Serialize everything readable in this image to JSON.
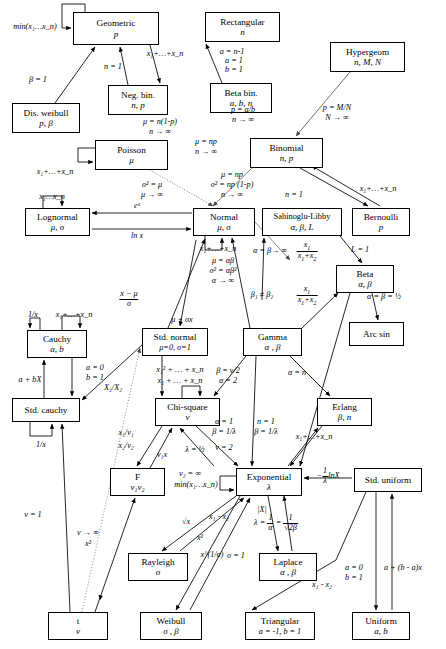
{
  "diagram": {
    "type": "directed-graph",
    "background": "#ffffff",
    "stroke": "#000000"
  },
  "nodes": [
    {
      "id": "geometric",
      "name": "Geometric",
      "params": "p",
      "x": 73,
      "y": 12,
      "w": 86,
      "h": 33
    },
    {
      "id": "rectangular",
      "name": "Rectangular",
      "params": "n",
      "x": 205,
      "y": 12,
      "w": 75,
      "h": 30
    },
    {
      "id": "hypergeom",
      "name": "Hypergeom",
      "params": "n, M, N",
      "x": 330,
      "y": 42,
      "w": 75,
      "h": 30
    },
    {
      "id": "negbin",
      "name": "Neg. bin.",
      "params": "n, p",
      "x": 108,
      "y": 85,
      "w": 60,
      "h": 30
    },
    {
      "id": "betabin",
      "name": "Beta bin.",
      "params": "a, b, n",
      "x": 210,
      "y": 83,
      "w": 62,
      "h": 30
    },
    {
      "id": "disweibull",
      "name": "Dis. weibull",
      "params": "p, β",
      "x": 12,
      "y": 103,
      "w": 68,
      "h": 30
    },
    {
      "id": "poisson",
      "name": "Poisson",
      "params": "μ",
      "x": 95,
      "y": 140,
      "w": 73,
      "h": 30
    },
    {
      "id": "binomial",
      "name": "Binomial",
      "params": "n, p",
      "x": 250,
      "y": 138,
      "w": 73,
      "h": 30
    },
    {
      "id": "lognormal",
      "name": "Lognormal",
      "params": "μ, σ",
      "x": 25,
      "y": 208,
      "w": 65,
      "h": 28
    },
    {
      "id": "normal",
      "name": "Normal",
      "params": "μ, σ",
      "x": 193,
      "y": 208,
      "w": 62,
      "h": 28
    },
    {
      "id": "sahinoglu",
      "name": "Sahinoglu-Libby",
      "params": "α, β, L",
      "x": 262,
      "y": 208,
      "w": 80,
      "h": 28
    },
    {
      "id": "bernoulli",
      "name": "Bernoulli",
      "params": "p",
      "x": 352,
      "y": 208,
      "w": 58,
      "h": 28
    },
    {
      "id": "beta",
      "name": "Beta",
      "params": "α, β",
      "x": 336,
      "y": 265,
      "w": 58,
      "h": 28
    },
    {
      "id": "arcsin",
      "name": "Arc sin",
      "params": "",
      "x": 349,
      "y": 322,
      "w": 55,
      "h": 24
    },
    {
      "id": "cauchy",
      "name": "Cauchy",
      "params": "a, b",
      "x": 27,
      "y": 330,
      "w": 60,
      "h": 28
    },
    {
      "id": "stdnormal",
      "name": "Std. normal",
      "params": "μ=0, σ=1",
      "x": 142,
      "y": 328,
      "w": 66,
      "h": 28
    },
    {
      "id": "gamma",
      "name": "Gamma",
      "params": "α , β",
      "x": 243,
      "y": 328,
      "w": 59,
      "h": 28
    },
    {
      "id": "stdcauchy",
      "name": "Std. cauchy",
      "params": "",
      "x": 12,
      "y": 398,
      "w": 68,
      "h": 24
    },
    {
      "id": "chisquare",
      "name": "Chi-square",
      "params": "ν",
      "x": 155,
      "y": 398,
      "w": 65,
      "h": 28
    },
    {
      "id": "erlang",
      "name": "Erlang",
      "params": "β, n",
      "x": 317,
      "y": 398,
      "w": 55,
      "h": 28
    },
    {
      "id": "f",
      "name": "F",
      "params": "ν₁ν₂",
      "x": 110,
      "y": 468,
      "w": 55,
      "h": 28
    },
    {
      "id": "exponential",
      "name": "Exponential",
      "params": "λ",
      "x": 236,
      "y": 468,
      "w": 66,
      "h": 28
    },
    {
      "id": "stduniform",
      "name": "Std. uniform",
      "params": "",
      "x": 354,
      "y": 468,
      "w": 68,
      "h": 24
    },
    {
      "id": "rayleigh",
      "name": "Rayleigh",
      "params": "σ",
      "x": 128,
      "y": 553,
      "w": 60,
      "h": 28
    },
    {
      "id": "laplace",
      "name": "Laplace",
      "params": "α , β",
      "x": 259,
      "y": 553,
      "w": 58,
      "h": 28
    },
    {
      "id": "t",
      "name": "t",
      "params": "ν",
      "x": 48,
      "y": 612,
      "w": 60,
      "h": 28
    },
    {
      "id": "weibull",
      "name": "Weibull",
      "params": "σ , β",
      "x": 140,
      "y": 612,
      "w": 62,
      "h": 28
    },
    {
      "id": "triangular",
      "name": "Triangular",
      "params": "a = -1, b = 1",
      "x": 245,
      "y": 612,
      "w": 70,
      "h": 28
    },
    {
      "id": "uniform",
      "name": "Uniform",
      "params": "a, b",
      "x": 352,
      "y": 612,
      "w": 58,
      "h": 28
    }
  ],
  "edge_labels": [
    {
      "id": "l-min-geom",
      "text": "min(x₁…x_n)",
      "x": 35,
      "y": 22
    },
    {
      "id": "l-sum-geom",
      "text": "x₁+…+x_n",
      "x": 165,
      "y": 49
    },
    {
      "id": "l-n1-geom",
      "text": "n = 1",
      "x": 113,
      "y": 62
    },
    {
      "id": "l-beta1",
      "text": "β = 1",
      "x": 38,
      "y": 75
    },
    {
      "id": "l-an1",
      "text": "a = n-1",
      "x": 222,
      "y": 48
    },
    {
      "id": "l-a1",
      "text": "a = 1",
      "x": 224,
      "y": 57
    },
    {
      "id": "l-b1",
      "text": "b = 1",
      "x": 224,
      "y": 66
    },
    {
      "id": "l-pab",
      "text": "p = a/b",
      "x": 222,
      "y": 106
    },
    {
      "id": "l-ninf1",
      "text": "n → ∞",
      "x": 222,
      "y": 116
    },
    {
      "id": "l-pmn",
      "text": "p = M/N",
      "x": 337,
      "y": 103
    },
    {
      "id": "l-ninf2",
      "text": "N → ∞",
      "x": 337,
      "y": 113
    },
    {
      "id": "l-munp1",
      "text": "μ = n(1-p)",
      "x": 143,
      "y": 117
    },
    {
      "id": "l-ninf3",
      "text": "n → ∞",
      "x": 143,
      "y": 127
    },
    {
      "id": "l-munp2",
      "text": "μ = np",
      "x": 192,
      "y": 138
    },
    {
      "id": "l-ninf4",
      "text": "n → ∞",
      "x": 192,
      "y": 148
    },
    {
      "id": "l-sum-poisson",
      "text": "x₁+…+x_n",
      "x": 40,
      "y": 168
    },
    {
      "id": "l-sigmamu",
      "text": "σ² = μ",
      "x": 135,
      "y": 180
    },
    {
      "id": "l-muinf",
      "text": "μ → ∞",
      "x": 135,
      "y": 190
    },
    {
      "id": "l-xs",
      "text": "x₁…x_n",
      "x": 40,
      "y": 192
    },
    {
      "id": "l-ex",
      "text": "eˣ",
      "x": 128,
      "y": 207
    },
    {
      "id": "l-lnx",
      "text": "ln x",
      "x": 128,
      "y": 228
    },
    {
      "id": "l-munp3",
      "text": "μ = np",
      "x": 208,
      "y": 170
    },
    {
      "id": "l-signp",
      "text": "σ² = np (1-p)",
      "x": 208,
      "y": 180
    },
    {
      "id": "l-ninf5",
      "text": "n → ∞",
      "x": 208,
      "y": 190
    },
    {
      "id": "l-n1b",
      "text": "n = 1",
      "x": 274,
      "y": 190
    },
    {
      "id": "l-sum-bern",
      "text": "x₁+…+x_n",
      "x": 364,
      "y": 184
    },
    {
      "id": "l-sum-normal",
      "text": "x₁+…+x_n",
      "x": 215,
      "y": 244
    },
    {
      "id": "l-muab",
      "text": "μ = αβ",
      "x": 219,
      "y": 256
    },
    {
      "id": "l-sigab",
      "text": "σ² = αβ²",
      "x": 219,
      "y": 266
    },
    {
      "id": "l-ainf",
      "text": "α → ∞",
      "x": 219,
      "y": 276
    },
    {
      "id": "l-abinf",
      "text": "α = β→ ∞",
      "x": 258,
      "y": 246
    },
    {
      "id": "l-x1x12a",
      "text": "x₁ / (x₁ + x₂)",
      "x": 307,
      "y": 248
    },
    {
      "id": "l-L1",
      "text": "L = 1",
      "x": 356,
      "y": 245
    },
    {
      "id": "l-b1b2",
      "text": "β₁ ≠ β₂",
      "x": 262,
      "y": 290
    },
    {
      "id": "l-x1x12b",
      "text": "x₁ / (x₁ + x₂)",
      "x": 305,
      "y": 290
    },
    {
      "id": "l-abhalf",
      "text": "α = β = ½",
      "x": 378,
      "y": 292
    },
    {
      "id": "l-xmusig",
      "text": "(x - μ) / σ",
      "x": 129,
      "y": 296
    },
    {
      "id": "l-musigx",
      "text": "μ + σx",
      "x": 182,
      "y": 315
    },
    {
      "id": "l-1x-cauchy",
      "text": "1/x",
      "x": 41,
      "y": 310
    },
    {
      "id": "l-sum-cauchy",
      "text": "x₁+…+x_n",
      "x": 72,
      "y": 310
    },
    {
      "id": "l-abX",
      "text": "a + bX",
      "x": 26,
      "y": 375
    },
    {
      "id": "l-a0",
      "text": "a = 0",
      "x": 91,
      "y": 363
    },
    {
      "id": "l-b1c",
      "text": "b = 1",
      "x": 91,
      "y": 373
    },
    {
      "id": "l-X1X2",
      "text": "X₁/X₂",
      "x": 113,
      "y": 382
    },
    {
      "id": "l-1x-std",
      "text": "1/x",
      "x": 41,
      "y": 440
    },
    {
      "id": "l-bnu2",
      "text": "β = ν/2",
      "x": 226,
      "y": 366
    },
    {
      "id": "l-a2",
      "text": "α = 2",
      "x": 226,
      "y": 376
    },
    {
      "id": "l-sq-sum",
      "text": "x₁² + … + x_n",
      "x": 176,
      "y": 365
    },
    {
      "id": "l-sum-chi",
      "text": "x₁ + … + x_n",
      "x": 176,
      "y": 376
    },
    {
      "id": "l-an",
      "text": "α = n",
      "x": 293,
      "y": 368
    },
    {
      "id": "l-a1g",
      "text": "α = 1",
      "x": 221,
      "y": 417
    },
    {
      "id": "l-b1l",
      "text": "β = 1/λ",
      "x": 221,
      "y": 427
    },
    {
      "id": "l-n1e",
      "text": "n = 1",
      "x": 262,
      "y": 417
    },
    {
      "id": "l-b1le",
      "text": "β = 1/λ",
      "x": 262,
      "y": 427
    },
    {
      "id": "l-sum-erlang",
      "text": "x₁+…+x_n",
      "x": 312,
      "y": 430
    },
    {
      "id": "l-x1v1",
      "text": "x₁/ν₁",
      "x": 124,
      "y": 428
    },
    {
      "id": "l-x2v2",
      "text": "x₂/ν₂",
      "x": 124,
      "y": 441
    },
    {
      "id": "l-v1x",
      "text": "ν₁x",
      "x": 160,
      "y": 450
    },
    {
      "id": "l-lhalf",
      "text": "λ = ½",
      "x": 193,
      "y": 445
    },
    {
      "id": "l-nu2",
      "text": "ν = 2",
      "x": 222,
      "y": 443
    },
    {
      "id": "l-v2inf",
      "text": "ν₂ = ∞",
      "x": 172,
      "y": 470
    },
    {
      "id": "l-minx",
      "text": "min(x₁…x_n)",
      "x": 178,
      "y": 481
    },
    {
      "id": "l-lnx2",
      "text": "- (1/λ) lnX",
      "x": 318,
      "y": 471
    },
    {
      "id": "l-nu1",
      "text": "ν = 1",
      "x": 33,
      "y": 510
    },
    {
      "id": "l-nuinf",
      "text": "ν → ∞",
      "x": 85,
      "y": 530
    },
    {
      "id": "l-x2t",
      "text": "x²",
      "x": 88,
      "y": 540
    },
    {
      "id": "l-sqrtx",
      "text": "√x",
      "x": 185,
      "y": 519
    },
    {
      "id": "l-x2r",
      "text": "x²",
      "x": 198,
      "y": 534
    },
    {
      "id": "l-x1a",
      "text": "x^(1/α)",
      "x": 210,
      "y": 550
    },
    {
      "id": "l-sig1",
      "text": "σ = 1",
      "x": 232,
      "y": 553
    },
    {
      "id": "l-x1x2e",
      "text": "x₁ - x₂",
      "x": 217,
      "y": 512
    },
    {
      "id": "l-absX",
      "text": "|X|",
      "x": 252,
      "y": 508
    },
    {
      "id": "l-lamab",
      "text": "λ = 1/α = 1/√(2β)",
      "x": 252,
      "y": 518
    },
    {
      "id": "l-x1x2t",
      "text": "x₁ - x₂",
      "x": 320,
      "y": 580
    },
    {
      "id": "l-a0u",
      "text": "a = 0",
      "x": 350,
      "y": 563
    },
    {
      "id": "l-b1u",
      "text": "b = 1",
      "x": 350,
      "y": 573
    },
    {
      "id": "l-abax",
      "text": "a + (b - a)x",
      "x": 394,
      "y": 563
    }
  ]
}
